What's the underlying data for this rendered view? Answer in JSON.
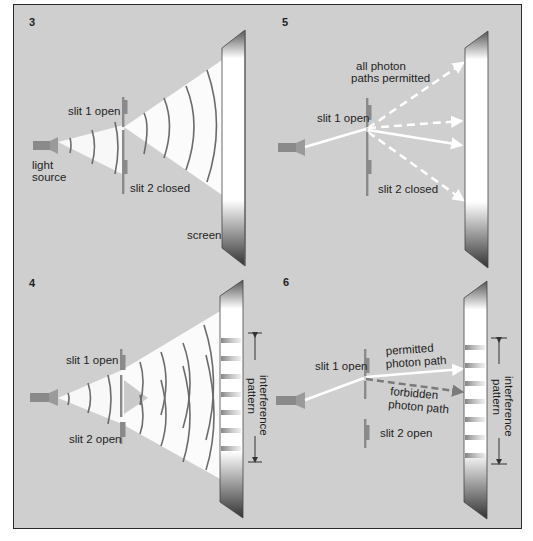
{
  "panels": [
    {
      "number": "3",
      "labels": {
        "slit1": "slit 1 open",
        "slit2": "slit 2 closed",
        "source": [
          "light",
          "source"
        ],
        "screen": "screen"
      }
    },
    {
      "number": "5",
      "labels": {
        "paths": [
          "all photon",
          "paths permitted"
        ],
        "slit1": "slit 1 open",
        "slit2": "slit 2 closed"
      }
    },
    {
      "number": "4",
      "labels": {
        "slit1": "slit 1 open",
        "slit2": "slit 2 open",
        "pattern": [
          "interference",
          "pattern"
        ]
      }
    },
    {
      "number": "6",
      "labels": {
        "slit1": "slit 1 open",
        "slit2": "slit 2 open",
        "permitted": [
          "permitted",
          "photon path"
        ],
        "forbidden": [
          "forbidden",
          "photon path"
        ],
        "pattern": [
          "interference",
          "pattern"
        ]
      }
    }
  ],
  "colors": {
    "background": "#cfcfcf",
    "frame": "#2a2a2a",
    "wave": "#6b6b6b",
    "beam": "#ffffff",
    "forbidden_path": "#7a7a7a"
  }
}
